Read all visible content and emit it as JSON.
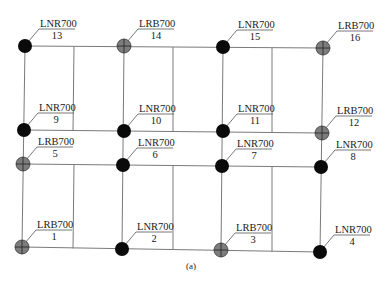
{
  "caption": "(a)",
  "colors": {
    "lnr_fill": "#0a0a0a",
    "lrb_fill": "#7d7d7d",
    "lrb_cross": "#2a2a2a",
    "beam": "#7a7a7a"
  },
  "legend_types": {
    "LNR700": "solid black circle (natural rubber bearing)",
    "LRB700": "grey circle with cross (lead rubber bearing)"
  },
  "rows": [
    {
      "y_left": 46,
      "y_right": 47
    },
    {
      "y_left": 130,
      "y_right": 133
    },
    {
      "y_left": 164,
      "y_right": 167
    },
    {
      "y_left": 247,
      "y_right": 252
    }
  ],
  "columns_x": [
    24,
    124,
    223,
    322
  ],
  "secondary_beams_x": [
    74,
    173,
    272
  ],
  "bearings": [
    {
      "id": "1",
      "type": "LRB700",
      "x": 22,
      "y": 247
    },
    {
      "id": "2",
      "type": "LNR700",
      "x": 122,
      "y": 249
    },
    {
      "id": "3",
      "type": "LRB700",
      "x": 221,
      "y": 250
    },
    {
      "id": "4",
      "type": "LNR700",
      "x": 320,
      "y": 252
    },
    {
      "id": "5",
      "type": "LRB700",
      "x": 23,
      "y": 164
    },
    {
      "id": "6",
      "type": "LNR700",
      "x": 123,
      "y": 165
    },
    {
      "id": "7",
      "type": "LNR700",
      "x": 222,
      "y": 166
    },
    {
      "id": "8",
      "type": "LNR700",
      "x": 321,
      "y": 167
    },
    {
      "id": "9",
      "type": "LNR700",
      "x": 24,
      "y": 130
    },
    {
      "id": "10",
      "type": "LNR700",
      "x": 124,
      "y": 131
    },
    {
      "id": "11",
      "type": "LNR700",
      "x": 223,
      "y": 131
    },
    {
      "id": "12",
      "type": "LRB700",
      "x": 322,
      "y": 133
    },
    {
      "id": "13",
      "type": "LNR700",
      "x": 25,
      "y": 46
    },
    {
      "id": "14",
      "type": "LRB700",
      "x": 124,
      "y": 46
    },
    {
      "id": "15",
      "type": "LNR700",
      "x": 223,
      "y": 47
    },
    {
      "id": "16",
      "type": "LRB700",
      "x": 323,
      "y": 48
    }
  ]
}
